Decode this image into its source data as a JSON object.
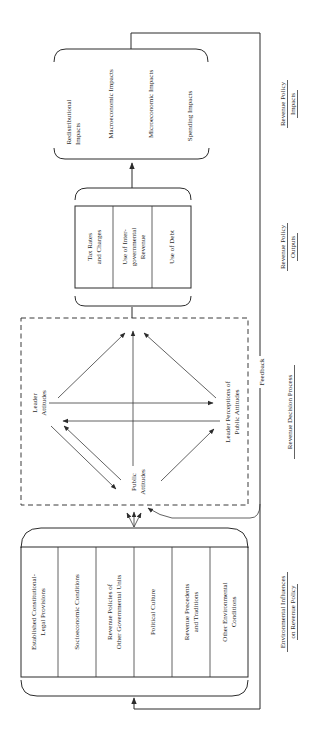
{
  "diagram": {
    "orientation": "rotated-90-ccw",
    "colors": {
      "ink": "#2b2b2b",
      "background": "#ffffff"
    },
    "environmental_influences": {
      "heading_line1": "Environmental Influences",
      "heading_line2": "on Revenue Policy",
      "items": [
        {
          "line1": "Established Constitutional-",
          "line2": "Legal Provisions"
        },
        {
          "line1": "Socioeconomic Conditions",
          "line2": ""
        },
        {
          "line1": "Revenue Policies of",
          "line2": "Other Governmental Units"
        },
        {
          "line1": "Political Culture",
          "line2": ""
        },
        {
          "line1": "Revenue Precedents",
          "line2": "and Traditions"
        },
        {
          "line1": "Other Environmental",
          "line2": "Conditions"
        }
      ]
    },
    "decision_process": {
      "heading": "Revenue Decision Process",
      "nodes": {
        "leader_attitudes": {
          "line1": "Leader",
          "line2": "Attitudes"
        },
        "public_attitudes": {
          "line1": "Public",
          "line2": "Attitudes"
        },
        "leader_perceptions": {
          "line1": "Leader Perceptions of",
          "line2": "Public Attitudes"
        }
      }
    },
    "outputs": {
      "heading_line1": "Revenue Policy",
      "heading_line2": "Outputs",
      "items": [
        {
          "line1": "Tax Rates",
          "line2": "and Charges",
          "line3": ""
        },
        {
          "line1": "Use of Inter-",
          "line2": "governmental",
          "line3": "Revenue"
        },
        {
          "line1": "Use of Debt",
          "line2": "",
          "line3": ""
        }
      ]
    },
    "impacts": {
      "heading_line1": "Revenue Policy",
      "heading_line2": "Impacts",
      "items": [
        {
          "line1": "Redistributional",
          "line2": "Impacts"
        },
        {
          "line1": "Macroeconomic Impacts",
          "line2": ""
        },
        {
          "line1": "Microeconomic Impacts",
          "line2": ""
        },
        {
          "line1": "Spending Impacts",
          "line2": ""
        }
      ]
    },
    "feedback_label": "Feedback"
  }
}
